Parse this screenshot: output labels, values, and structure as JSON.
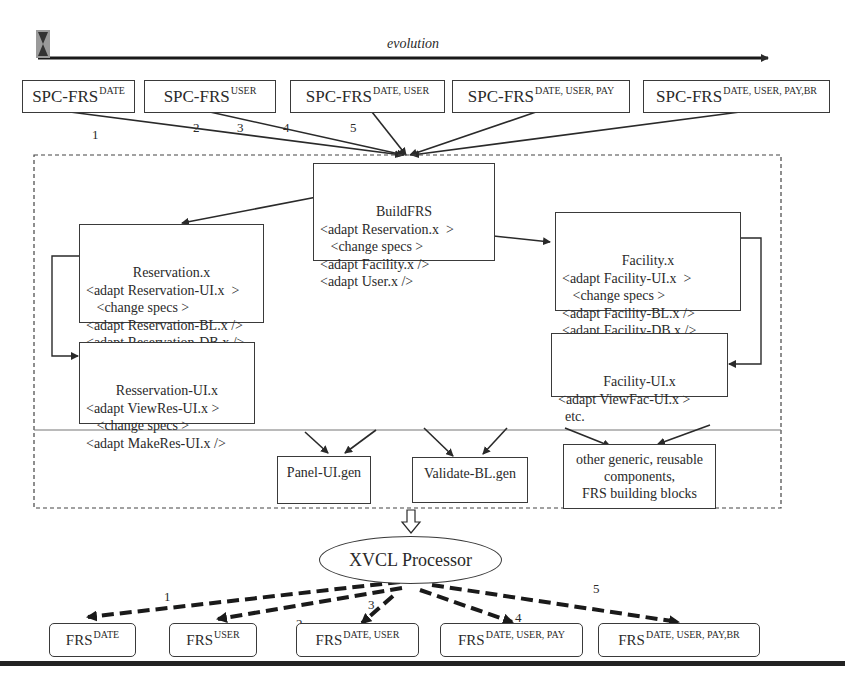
{
  "timeline": {
    "label": "evolution",
    "icon": "hourglass-icon"
  },
  "spc_boxes": [
    {
      "base": "SPC-FRS",
      "sup": "DATE"
    },
    {
      "base": "SPC-FRS",
      "sup": "USER"
    },
    {
      "base": "SPC-FRS",
      "sup": "DATE, USER"
    },
    {
      "base": "SPC-FRS",
      "sup": "DATE, USER, PAY"
    },
    {
      "base": "SPC-FRS",
      "sup": "DATE, USER, PAY,BR"
    }
  ],
  "spc_edge_labels": [
    "1",
    "2",
    "3",
    "4",
    "5"
  ],
  "buildfrs": {
    "title": "BuildFRS",
    "lines": [
      "<adapt Reservation.x  >",
      "   <change specs >",
      "<adapt Facility.x />",
      "<adapt User.x />"
    ]
  },
  "reservation": {
    "title": "Reservation.x",
    "lines": [
      "<adapt Reservation-UI.x  >",
      "   <change specs >",
      "<adapt Reservation-BL.x />",
      "<adapt Reservation-DB.x />"
    ]
  },
  "reservation_ui": {
    "title": "Resservation-UI.x",
    "lines": [
      "<adapt ViewRes-UI.x >",
      "   <change specs >",
      "<adapt MakeRes-UI.x />"
    ]
  },
  "facility": {
    "title": "Facility.x",
    "lines": [
      "<adapt Facility-UI.x  >",
      "   <change specs >",
      "<adapt Facility-BL.x />",
      "<adapt Facility-DB.x />"
    ]
  },
  "facility_ui": {
    "title": "Facility-UI.x",
    "lines": [
      "<adapt ViewFac-UI.x >",
      "  etc."
    ]
  },
  "generic": {
    "panel": "Panel-UI.gen",
    "validate": "Validate-BL.gen",
    "other": [
      "other generic, reusable",
      "components,",
      "FRS building blocks"
    ]
  },
  "processor": {
    "label": "XVCL Processor"
  },
  "frs_outputs": [
    {
      "base": "FRS",
      "sup": "DATE"
    },
    {
      "base": "FRS",
      "sup": "USER"
    },
    {
      "base": "FRS",
      "sup": "DATE, USER"
    },
    {
      "base": "FRS",
      "sup": "DATE, USER, PAY"
    },
    {
      "base": "FRS",
      "sup": "DATE, USER, PAY,BR"
    }
  ],
  "output_edge_labels": [
    "1",
    "2",
    "3",
    "4",
    "5"
  ],
  "colors": {
    "line": "#2a2a2a",
    "box_border": "#3a3a3a",
    "background": "#ffffff"
  }
}
